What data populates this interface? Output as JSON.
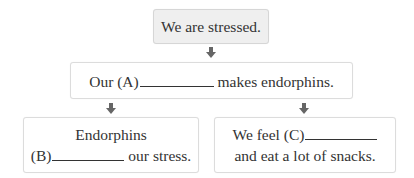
{
  "diagram": {
    "top_box": {
      "text": "We are stressed."
    },
    "middle_box": {
      "before": "Our (A)",
      "after": "makes endorphins."
    },
    "left_box": {
      "line1": "Endorphins",
      "before": "(B)",
      "after": "our stress."
    },
    "right_box": {
      "before": "We feel (C)",
      "line2": "and eat a lot of snacks."
    },
    "colors": {
      "top_fill": "#efefef",
      "border": "#dcdcdc",
      "arrow": "#666666",
      "text": "#333333"
    }
  }
}
